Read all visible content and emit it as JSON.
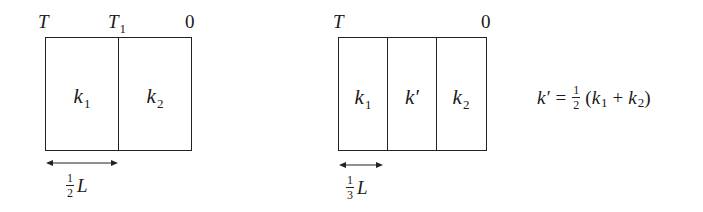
{
  "diagram": {
    "left_panel": {
      "top_labels": {
        "left": "T",
        "middle": "T",
        "middle_sub": "1",
        "right": "0"
      },
      "cells": [
        {
          "name": "k",
          "sub": "1"
        },
        {
          "name": "k",
          "sub": "2"
        }
      ],
      "dimension": {
        "frac_num": "1",
        "frac_den": "2",
        "var": "L"
      }
    },
    "right_panel": {
      "top_labels": {
        "left": "T",
        "right": "0"
      },
      "cells": [
        {
          "name": "k",
          "sub": "1"
        },
        {
          "name": "k′",
          "sub": ""
        },
        {
          "name": "k",
          "sub": "2"
        }
      ],
      "dimension": {
        "frac_num": "1",
        "frac_den": "3",
        "var": "L"
      }
    },
    "equation": {
      "lhs": "k′",
      "equals": "=",
      "frac_num": "1",
      "frac_den": "2",
      "open": "(",
      "t1": "k",
      "t1_sub": "1",
      "plus": "+",
      "t2": "k",
      "t2_sub": "2",
      "close": ")"
    },
    "colors": {
      "line": "#222222",
      "text": "#1a1a1a",
      "background": "#ffffff"
    }
  }
}
